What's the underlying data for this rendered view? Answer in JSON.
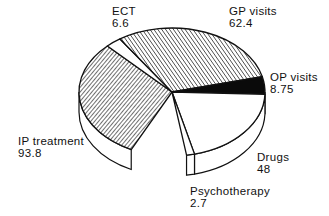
{
  "chart_data": {
    "type": "pie",
    "style": "3d-exploded-none",
    "title": "",
    "units": "",
    "slices": [
      {
        "label": "IP treatment",
        "value": 93.8,
        "fill": "hatch-dense",
        "start_deg": 116,
        "end_deg": 226
      },
      {
        "label": "ECT",
        "value": 6.6,
        "fill": "white",
        "start_deg": 226,
        "end_deg": 236
      },
      {
        "label": "GP visits",
        "value": 62.4,
        "fill": "hatch",
        "start_deg": 236,
        "end_deg": 346
      },
      {
        "label": "OP visits",
        "value": 8.75,
        "fill": "black",
        "start_deg": 346,
        "end_deg": 362
      },
      {
        "label": "Drugs",
        "value": 48,
        "fill": "white",
        "start_deg": 2,
        "end_deg": 76
      },
      {
        "label": "Psychotherapy",
        "value": 2.7,
        "fill": "white",
        "start_deg": 76,
        "end_deg": 81
      }
    ],
    "legend": "none (direct labels)"
  },
  "labels": {
    "ect": {
      "name": "ECT",
      "value": "6.6"
    },
    "gp": {
      "name": "GP visits",
      "value": "62.4"
    },
    "op": {
      "name": "OP visits",
      "value": "8.75"
    },
    "ip": {
      "name": "IP treatment",
      "value": "93.8"
    },
    "drugs": {
      "name": "Drugs",
      "value": "48"
    },
    "psycho": {
      "name": "Psychotherapy",
      "value": "2.7"
    }
  },
  "colors": {
    "stroke": "#111111",
    "background": "#ffffff",
    "black_fill": "#0a0a0a"
  }
}
